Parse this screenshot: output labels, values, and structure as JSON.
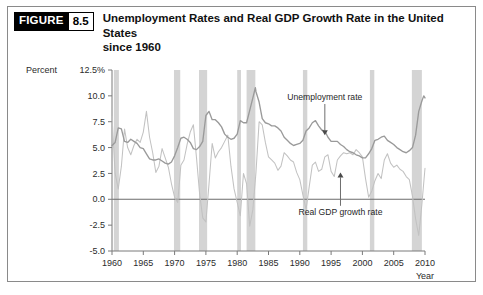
{
  "figure": {
    "badge_word": "FIGURE",
    "badge_number": "8.5",
    "title_line_1": "Unemployment Rates and Real GDP Growth Rate in the United States",
    "title_line_2": "since 1960"
  },
  "chart_data": {
    "type": "line",
    "title": "Unemployment Rates and Real GDP Growth Rate in the United States since 1960",
    "xlabel": "Year",
    "ylabel": "Percent",
    "ylabel_unit_tick": "12.5%",
    "xlim": [
      1960,
      2010
    ],
    "ylim": [
      -5.0,
      12.5
    ],
    "grid": false,
    "legend_position": "inline-annotations",
    "yticks": [
      "12.5%",
      "10.0",
      "7.5",
      "5.0",
      "2.5",
      "0.0",
      "-2.5",
      "-5.0"
    ],
    "ytick_values": [
      12.5,
      10.0,
      7.5,
      5.0,
      2.5,
      0.0,
      -2.5,
      -5.0
    ],
    "xticks": [
      "1960",
      "1965",
      "1970",
      "1975",
      "1980",
      "1985",
      "1990",
      "1995",
      "2000",
      "2005",
      "2010"
    ],
    "xtick_values": [
      1960,
      1965,
      1970,
      1975,
      1980,
      1985,
      1990,
      1995,
      2000,
      2005,
      2010
    ],
    "annotations": [
      {
        "text": "Unemployment rate",
        "x": 1994.0,
        "y": 9.6,
        "arrow_to_y": 6.2,
        "direction": "down"
      },
      {
        "text": "Real GDP growth rate",
        "x": 1996.5,
        "y": -1.5,
        "arrow_to_y": 2.6,
        "direction": "up"
      }
    ],
    "recession_bands": [
      {
        "start": 1960.3,
        "end": 1961.1
      },
      {
        "start": 1969.9,
        "end": 1970.9
      },
      {
        "start": 1973.9,
        "end": 1975.2
      },
      {
        "start": 1980.0,
        "end": 1980.6
      },
      {
        "start": 1981.5,
        "end": 1982.9
      },
      {
        "start": 1990.5,
        "end": 1991.2
      },
      {
        "start": 2001.2,
        "end": 2001.9
      },
      {
        "start": 2007.9,
        "end": 2009.5
      }
    ],
    "series": [
      {
        "name": "Unemployment rate",
        "color": "#9a9a9a",
        "x": [
          1960.0,
          1960.5,
          1961.0,
          1961.5,
          1962.0,
          1962.5,
          1963.0,
          1963.5,
          1964.0,
          1964.5,
          1965.0,
          1965.5,
          1966.0,
          1966.5,
          1967.0,
          1967.5,
          1968.0,
          1968.5,
          1969.0,
          1969.5,
          1970.0,
          1970.5,
          1971.0,
          1971.5,
          1972.0,
          1972.5,
          1973.0,
          1973.5,
          1974.0,
          1974.5,
          1975.0,
          1975.5,
          1976.0,
          1976.5,
          1977.0,
          1977.5,
          1978.0,
          1978.5,
          1979.0,
          1979.5,
          1980.0,
          1980.5,
          1981.0,
          1981.5,
          1982.0,
          1982.5,
          1982.9,
          1983.0,
          1983.5,
          1984.0,
          1984.5,
          1985.0,
          1985.5,
          1986.0,
          1986.5,
          1987.0,
          1987.5,
          1988.0,
          1988.5,
          1989.0,
          1989.5,
          1990.0,
          1990.5,
          1991.0,
          1991.5,
          1992.0,
          1992.5,
          1993.0,
          1993.5,
          1994.0,
          1994.5,
          1995.0,
          1995.5,
          1996.0,
          1996.5,
          1997.0,
          1997.5,
          1998.0,
          1998.5,
          1999.0,
          1999.5,
          2000.0,
          2000.5,
          2001.0,
          2001.5,
          2002.0,
          2002.5,
          2003.0,
          2003.5,
          2004.0,
          2004.5,
          2005.0,
          2005.5,
          2006.0,
          2006.5,
          2007.0,
          2007.5,
          2008.0,
          2008.5,
          2009.0,
          2009.5,
          2009.8,
          2010.0
        ],
        "values": [
          5.2,
          5.5,
          6.9,
          6.8,
          5.6,
          5.5,
          5.8,
          5.6,
          5.4,
          5.0,
          4.9,
          4.4,
          3.9,
          3.8,
          3.8,
          3.9,
          3.7,
          3.5,
          3.4,
          3.6,
          4.2,
          5.0,
          5.9,
          6.0,
          5.8,
          5.5,
          4.9,
          4.8,
          5.1,
          5.6,
          8.1,
          8.5,
          7.7,
          7.7,
          7.4,
          7.0,
          6.3,
          6.0,
          5.8,
          5.9,
          6.3,
          7.6,
          7.4,
          7.4,
          8.6,
          9.8,
          10.8,
          10.4,
          9.4,
          7.8,
          7.4,
          7.3,
          7.1,
          7.1,
          6.9,
          6.6,
          6.0,
          5.7,
          5.4,
          5.2,
          5.3,
          5.4,
          5.7,
          6.6,
          6.9,
          7.4,
          7.6,
          7.1,
          6.7,
          6.6,
          6.0,
          5.6,
          5.6,
          5.6,
          5.3,
          5.1,
          4.8,
          4.6,
          4.5,
          4.3,
          4.2,
          4.0,
          4.0,
          4.4,
          4.9,
          5.7,
          5.8,
          6.0,
          6.1,
          5.7,
          5.5,
          5.3,
          5.0,
          4.8,
          4.6,
          4.5,
          4.7,
          5.0,
          6.2,
          8.5,
          9.5,
          10.0,
          9.8
        ]
      },
      {
        "name": "Real GDP growth rate",
        "color": "#c2c2c2",
        "x": [
          1960.0,
          1960.5,
          1961.0,
          1961.5,
          1962.0,
          1962.5,
          1963.0,
          1963.5,
          1964.0,
          1964.5,
          1965.0,
          1965.5,
          1966.0,
          1966.5,
          1967.0,
          1967.5,
          1968.0,
          1968.5,
          1969.0,
          1969.5,
          1970.0,
          1970.5,
          1971.0,
          1971.5,
          1972.0,
          1972.5,
          1973.0,
          1973.5,
          1974.0,
          1974.5,
          1975.0,
          1975.5,
          1976.0,
          1976.5,
          1977.0,
          1977.5,
          1978.0,
          1978.5,
          1979.0,
          1979.5,
          1980.0,
          1980.5,
          1981.0,
          1981.5,
          1982.0,
          1982.5,
          1983.0,
          1983.5,
          1984.0,
          1984.5,
          1985.0,
          1985.5,
          1986.0,
          1986.5,
          1987.0,
          1987.5,
          1988.0,
          1988.5,
          1989.0,
          1989.5,
          1990.0,
          1990.5,
          1991.0,
          1991.5,
          1992.0,
          1992.5,
          1993.0,
          1993.5,
          1994.0,
          1994.5,
          1995.0,
          1995.5,
          1996.0,
          1996.5,
          1997.0,
          1997.5,
          1998.0,
          1998.5,
          1999.0,
          1999.5,
          2000.0,
          2000.5,
          2001.0,
          2001.5,
          2002.0,
          2002.5,
          2003.0,
          2003.5,
          2004.0,
          2004.5,
          2005.0,
          2005.5,
          2006.0,
          2006.5,
          2007.0,
          2007.5,
          2008.0,
          2008.5,
          2009.0,
          2009.5,
          2010.0
        ],
        "values": [
          8.0,
          2.5,
          1.0,
          3.2,
          6.8,
          5.0,
          4.3,
          5.2,
          5.8,
          5.5,
          6.5,
          8.5,
          6.0,
          4.5,
          2.6,
          3.2,
          4.9,
          4.0,
          3.1,
          1.5,
          0.2,
          -0.3,
          3.3,
          3.8,
          5.3,
          6.5,
          7.2,
          4.0,
          0.5,
          -1.8,
          -2.2,
          1.5,
          5.4,
          4.0,
          4.6,
          5.0,
          5.6,
          6.2,
          3.2,
          1.0,
          -0.3,
          -1.6,
          2.5,
          1.5,
          -2.6,
          -1.0,
          2.6,
          7.5,
          7.2,
          5.5,
          4.1,
          3.8,
          3.5,
          2.8,
          3.2,
          4.5,
          4.2,
          3.8,
          3.6,
          2.6,
          1.9,
          0.4,
          -1.0,
          1.2,
          3.3,
          3.6,
          2.7,
          2.9,
          4.1,
          4.3,
          2.7,
          2.2,
          3.8,
          4.2,
          4.5,
          4.4,
          4.5,
          4.3,
          4.8,
          4.5,
          4.1,
          2.0,
          0.2,
          0.8,
          1.8,
          2.5,
          2.0,
          3.8,
          4.4,
          3.5,
          3.1,
          3.3,
          2.9,
          2.7,
          2.2,
          1.9,
          0.3,
          -1.9,
          -3.5,
          -0.5,
          3.0
        ]
      }
    ]
  }
}
